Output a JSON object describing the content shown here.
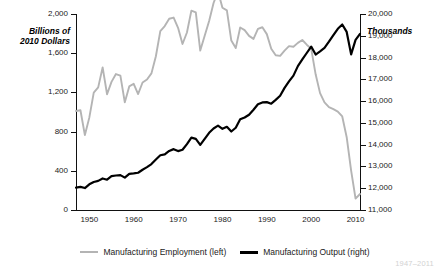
{
  "chart_data": {
    "type": "line",
    "title": "",
    "subtitle": "",
    "xlabel": "",
    "ylabel": "Billions of 2010 Dollars",
    "y2label": "Thousands",
    "grid": false,
    "legend_position": "bottom",
    "xlim": [
      1947,
      2011
    ],
    "ylim": [
      0,
      2000
    ],
    "y2lim": [
      11000,
      20000
    ],
    "xticks": [
      1950,
      1960,
      1970,
      1980,
      1990,
      2000,
      2010
    ],
    "xticklabels": [
      "1950",
      "1960",
      "1970",
      "1980",
      "1990",
      "2000",
      "2010"
    ],
    "yticks": [
      0,
      400,
      800,
      1200,
      1600,
      2000
    ],
    "yticklabels": [
      "0",
      "400",
      "800",
      "1,200",
      "1,600",
      "2,000"
    ],
    "y2ticks": [
      11000,
      12000,
      13000,
      14000,
      15000,
      16000,
      17000,
      18000,
      19000,
      20000
    ],
    "y2ticklabels": [
      "11,000",
      "12,000",
      "13,000",
      "14,000",
      "15,000",
      "16,000",
      "17,000",
      "18,000",
      "19,000",
      "20,000"
    ],
    "x": [
      1947,
      1948,
      1949,
      1950,
      1951,
      1952,
      1953,
      1954,
      1955,
      1956,
      1957,
      1958,
      1959,
      1960,
      1961,
      1962,
      1963,
      1964,
      1965,
      1966,
      1967,
      1968,
      1969,
      1970,
      1971,
      1972,
      1973,
      1974,
      1975,
      1976,
      1977,
      1978,
      1979,
      1980,
      1981,
      1982,
      1983,
      1984,
      1985,
      1986,
      1987,
      1988,
      1989,
      1990,
      1991,
      1992,
      1993,
      1994,
      1995,
      1996,
      1997,
      1998,
      1999,
      2000,
      2001,
      2002,
      2003,
      2004,
      2005,
      2006,
      2007,
      2008,
      2009,
      2010,
      2011
    ],
    "series": [
      {
        "name": "Manufacturing Employment (left)",
        "axis": "right",
        "units": "thousands",
        "color": "#b4b4b4",
        "values": [
          15545,
          15582,
          14441,
          15241,
          16393,
          16632,
          17549,
          16314,
          16882,
          17243,
          17174,
          15945,
          16675,
          16796,
          16326,
          16853,
          16995,
          17274,
          18062,
          19214,
          19447,
          19781,
          19837,
          19367,
          18623,
          19151,
          20154,
          20077,
          18323,
          18997,
          19682,
          20505,
          21040,
          20285,
          20170,
          18781,
          18434,
          19378,
          19260,
          18994,
          18856,
          19314,
          19391,
          19076,
          18406,
          18104,
          18075,
          18321,
          18524,
          18495,
          18675,
          18805,
          18591,
          18408,
          17230,
          16368,
          15941,
          15726,
          15629,
          15521,
          15294,
          14342,
          12809,
          11524,
          11736
        ]
      },
      {
        "name": "Manufacturing Output (right)",
        "axis": "left",
        "units": "billions of 2010 dollars",
        "color": "#000000",
        "values": [
          228,
          236,
          224,
          262,
          286,
          297,
          322,
          309,
          345,
          352,
          356,
          330,
          368,
          373,
          380,
          411,
          437,
          469,
          516,
          559,
          568,
          603,
          621,
          601,
          615,
          672,
          739,
          726,
          664,
          726,
          788,
          832,
          861,
          828,
          849,
          801,
          839,
          925,
          944,
          972,
          1023,
          1079,
          1098,
          1101,
          1085,
          1124,
          1166,
          1246,
          1312,
          1371,
          1468,
          1536,
          1602,
          1668,
          1586,
          1618,
          1654,
          1717,
          1784,
          1849,
          1893,
          1817,
          1588,
          1736,
          1798
        ]
      }
    ],
    "footnote": "1947–2011"
  },
  "legend": {
    "items": [
      {
        "label": "Manufacturing Employment (left)",
        "color": "#b4b4b4"
      },
      {
        "label": "Manufacturing Output (right)",
        "color": "#000000"
      }
    ]
  }
}
